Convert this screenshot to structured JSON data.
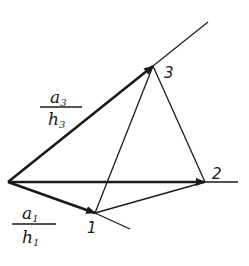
{
  "diagram": {
    "stroke_color": "#1a1a1a",
    "background": "#ffffff",
    "origin": {
      "x": 8,
      "y": 182
    },
    "points": [
      {
        "id": "1",
        "label": "1",
        "x": 95,
        "y": 213
      },
      {
        "id": "2",
        "label": "2",
        "x": 205,
        "y": 182
      },
      {
        "id": "3",
        "label": "3",
        "x": 153,
        "y": 66
      }
    ],
    "vectors": [
      {
        "to": "1",
        "label_num": "a",
        "label_num_sub": "1",
        "label_den": "h",
        "label_den_sub": "1"
      },
      {
        "to": "2"
      },
      {
        "to": "3",
        "label_num": "a",
        "label_num_sub": "3",
        "label_den": "h",
        "label_den_sub": "3"
      }
    ],
    "extension_lines": [
      {
        "from": "3",
        "to_xy": [
          208,
          22
        ]
      },
      {
        "from": "2",
        "to_xy": [
          238,
          182
        ]
      },
      {
        "from": "1",
        "to_xy": [
          130,
          229
        ]
      }
    ],
    "labels": {
      "point1": "1",
      "point2": "2",
      "point3": "3",
      "a1_num": "a",
      "a1_sub": "1",
      "h1_den": "h",
      "h1_sub": "1",
      "a3_num": "a",
      "a3_sub": "3",
      "h3_den": "h",
      "h3_sub": "3"
    }
  }
}
